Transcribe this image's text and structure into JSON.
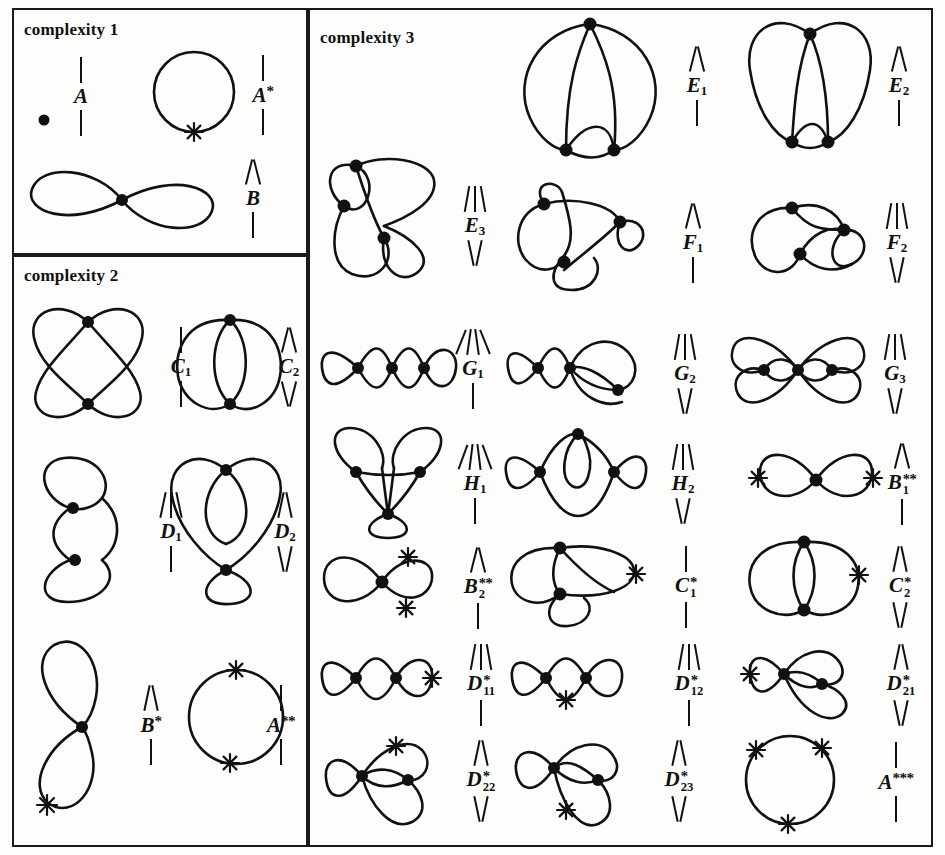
{
  "figure": {
    "panels": [
      {
        "id": "complexity-1",
        "title": "complexity 1"
      },
      {
        "id": "complexity-2",
        "title": "complexity 2"
      },
      {
        "id": "complexity-3",
        "title": "complexity 3"
      }
    ]
  },
  "items": {
    "A": {
      "name": "A",
      "base": "A",
      "sub": "",
      "stars": 0,
      "ticks_above": 1,
      "ticks_below": 1,
      "vertices": 0,
      "marks": 0
    },
    "Astar": {
      "name": "A*",
      "base": "A",
      "sub": "",
      "stars": 1,
      "ticks_above": 1,
      "ticks_below": 1,
      "vertices": 0,
      "marks": 1
    },
    "B": {
      "name": "B",
      "base": "B",
      "sub": "",
      "stars": 0,
      "ticks_above": 2,
      "ticks_below": 1,
      "vertices": 1,
      "marks": 0
    },
    "C1": {
      "name": "C1",
      "base": "C",
      "sub": "1",
      "stars": 0,
      "ticks_above": 1,
      "ticks_below": 1,
      "vertices": 2,
      "marks": 0
    },
    "C2": {
      "name": "C2",
      "base": "C",
      "sub": "2",
      "stars": 0,
      "ticks_above": 2,
      "ticks_below": 2,
      "vertices": 2,
      "marks": 0
    },
    "D1": {
      "name": "D1",
      "base": "D",
      "sub": "1",
      "stars": 0,
      "ticks_above": 3,
      "ticks_below": 1,
      "vertices": 2,
      "marks": 0
    },
    "D2": {
      "name": "D2",
      "base": "D",
      "sub": "2",
      "stars": 0,
      "ticks_above": 2,
      "ticks_below": 2,
      "vertices": 2,
      "marks": 0
    },
    "Bstar": {
      "name": "B*",
      "base": "B",
      "sub": "",
      "stars": 1,
      "ticks_above": 2,
      "ticks_below": 1,
      "vertices": 1,
      "marks": 1
    },
    "A2star": {
      "name": "A**",
      "base": "A",
      "sub": "",
      "stars": 2,
      "ticks_above": 1,
      "ticks_below": 1,
      "vertices": 0,
      "marks": 2
    },
    "E1": {
      "name": "E1",
      "base": "E",
      "sub": "1",
      "stars": 0,
      "ticks_above": 2,
      "ticks_below": 1,
      "vertices": 3,
      "marks": 0
    },
    "E2": {
      "name": "E2",
      "base": "E",
      "sub": "2",
      "stars": 0,
      "ticks_above": 2,
      "ticks_below": 1,
      "vertices": 3,
      "marks": 0
    },
    "E3": {
      "name": "E3",
      "base": "E",
      "sub": "3",
      "stars": 0,
      "ticks_above": 3,
      "ticks_below": 2,
      "vertices": 3,
      "marks": 0
    },
    "F1": {
      "name": "F1",
      "base": "F",
      "sub": "1",
      "stars": 0,
      "ticks_above": 2,
      "ticks_below": 1,
      "vertices": 3,
      "marks": 0
    },
    "F2": {
      "name": "F2",
      "base": "F",
      "sub": "2",
      "stars": 0,
      "ticks_above": 3,
      "ticks_below": 2,
      "vertices": 3,
      "marks": 0
    },
    "G1": {
      "name": "G1",
      "base": "G",
      "sub": "1",
      "stars": 0,
      "ticks_above": 4,
      "ticks_below": 1,
      "vertices": 3,
      "marks": 0
    },
    "G2": {
      "name": "G2",
      "base": "G",
      "sub": "2",
      "stars": 0,
      "ticks_above": 3,
      "ticks_below": 2,
      "vertices": 3,
      "marks": 0
    },
    "G3": {
      "name": "G3",
      "base": "G",
      "sub": "3",
      "stars": 0,
      "ticks_above": 3,
      "ticks_below": 2,
      "vertices": 3,
      "marks": 0
    },
    "H1": {
      "name": "H1",
      "base": "H",
      "sub": "1",
      "stars": 0,
      "ticks_above": 4,
      "ticks_below": 1,
      "vertices": 3,
      "marks": 0
    },
    "H2": {
      "name": "H2",
      "base": "H",
      "sub": "2",
      "stars": 0,
      "ticks_above": 3,
      "ticks_below": 2,
      "vertices": 3,
      "marks": 0
    },
    "B1ss": {
      "name": "B1**",
      "base": "B",
      "sub": "1",
      "stars": 2,
      "ticks_above": 2,
      "ticks_below": 1,
      "vertices": 1,
      "marks": 2
    },
    "B2ss": {
      "name": "B2**",
      "base": "B",
      "sub": "2",
      "stars": 2,
      "ticks_above": 2,
      "ticks_below": 1,
      "vertices": 1,
      "marks": 2
    },
    "C1s": {
      "name": "C1*",
      "base": "C",
      "sub": "1",
      "stars": 1,
      "ticks_above": 1,
      "ticks_below": 1,
      "vertices": 2,
      "marks": 1
    },
    "C2s": {
      "name": "C2*",
      "base": "C",
      "sub": "2",
      "stars": 1,
      "ticks_above": 2,
      "ticks_below": 2,
      "vertices": 2,
      "marks": 1
    },
    "D11s": {
      "name": "D11*",
      "base": "D",
      "sub": "11",
      "stars": 1,
      "ticks_above": 3,
      "ticks_below": 1,
      "vertices": 2,
      "marks": 1
    },
    "D12s": {
      "name": "D12*",
      "base": "D",
      "sub": "12",
      "stars": 1,
      "ticks_above": 3,
      "ticks_below": 1,
      "vertices": 2,
      "marks": 1
    },
    "D21s": {
      "name": "D21*",
      "base": "D",
      "sub": "21",
      "stars": 1,
      "ticks_above": 2,
      "ticks_below": 2,
      "vertices": 2,
      "marks": 1
    },
    "D22s": {
      "name": "D22*",
      "base": "D",
      "sub": "22",
      "stars": 1,
      "ticks_above": 2,
      "ticks_below": 2,
      "vertices": 2,
      "marks": 1
    },
    "D23s": {
      "name": "D23*",
      "base": "D",
      "sub": "23",
      "stars": 1,
      "ticks_above": 2,
      "ticks_below": 2,
      "vertices": 2,
      "marks": 1
    },
    "A3star": {
      "name": "A***",
      "base": "A",
      "sub": "",
      "stars": 3,
      "ticks_above": 1,
      "ticks_below": 1,
      "vertices": 0,
      "marks": 3
    }
  },
  "colors": {
    "ink": "#111111",
    "paper": "#fdfdfb",
    "border": "#1a1a1a"
  }
}
